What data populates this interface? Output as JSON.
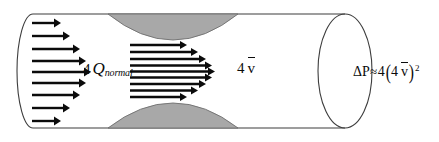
{
  "figure": {
    "type": "fluid-dynamics-diagram",
    "width": 439,
    "height": 142,
    "background_color": "#ffffff"
  },
  "colors": {
    "outline": "#3d3d3d",
    "arrow": "#0b0b0b",
    "plaque_fill": "#a8a8a8",
    "plaque_stroke": "#6e6e6e",
    "text": "#0b0b0b"
  },
  "vessel": {
    "name": "cylinder",
    "left_cap_kind": "half-ellipse-back-edge",
    "right_cap_kind": "full-ellipse-open-end",
    "top_wall_y": 14,
    "bottom_wall_y": 128,
    "left_x": 18,
    "right_x": 388
  },
  "constriction": {
    "label": "stenosis",
    "shape": "lens",
    "count": 2,
    "positions": [
      "top",
      "bottom"
    ],
    "fill": "#a8a8a8",
    "start_x": 108,
    "end_x": 238
  },
  "arrows": {
    "inlet": {
      "name": "inlet-velocity-profile",
      "profile": "parabolic",
      "count": 9,
      "start_x": 32,
      "lengths": [
        29,
        38,
        48,
        54,
        59,
        54,
        48,
        38,
        29
      ],
      "ys": [
        23,
        36,
        49,
        61,
        72,
        83,
        95,
        108,
        121
      ]
    },
    "throat": {
      "name": "throat-velocity-profile",
      "profile": "blunt",
      "count": 9,
      "start_x": 130,
      "lengths": [
        57,
        68,
        76,
        82,
        85,
        82,
        76,
        68,
        57
      ],
      "ys": [
        45,
        52,
        59,
        65,
        71,
        77,
        83,
        90,
        97
      ]
    }
  },
  "labels": {
    "flow": {
      "name": "flow-rate-label",
      "multiplier": "4",
      "symbol": "Q",
      "subscript": "normal",
      "text": "4 Qnormal"
    },
    "velocity": {
      "name": "velocity-label",
      "multiplier": "4",
      "symbol": "v",
      "accent": "bar",
      "text": "4 v̄"
    },
    "pressure": {
      "name": "pressure-drop-equation",
      "lhs": "ΔP",
      "relation": "≈",
      "coefficient": "4",
      "open_paren": "(",
      "inner_multiplier": "4",
      "inner_symbol": "v",
      "close_paren": ")",
      "exponent": "2",
      "text": "ΔP≈4(4 v̄)²"
    }
  }
}
